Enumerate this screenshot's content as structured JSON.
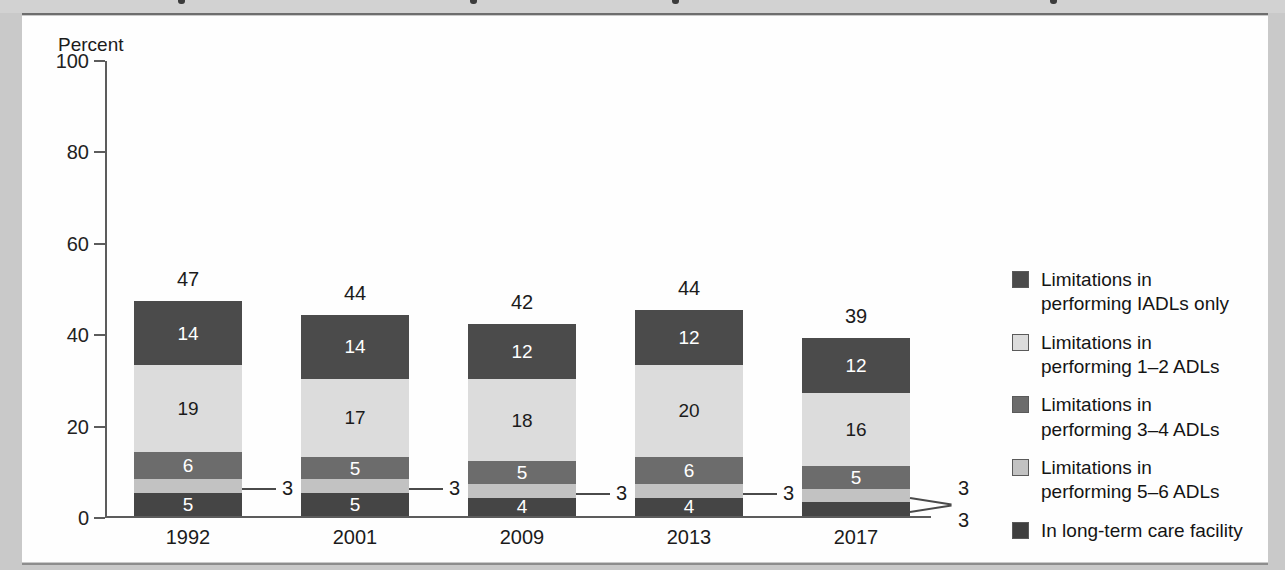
{
  "panel": {
    "axis_title": "Percent"
  },
  "chart_data": {
    "type": "bar",
    "subtype": "stacked-vertical",
    "title": "",
    "xlabel": "",
    "ylabel": "Percent",
    "ylim": [
      0,
      100
    ],
    "yticks": [
      0,
      20,
      40,
      60,
      80,
      100
    ],
    "grid": false,
    "legend_position": "right",
    "categories": [
      "1992",
      "2001",
      "2009",
      "2013",
      "2017"
    ],
    "totals": [
      47,
      44,
      42,
      44,
      39
    ],
    "series": [
      {
        "name": "In long-term care facility",
        "color": "#454545",
        "label_color": "#ffffff",
        "values": [
          5,
          5,
          4,
          4,
          3
        ],
        "labels_outside": [
          false,
          false,
          false,
          false,
          true
        ]
      },
      {
        "name": "Limitations in performing 5–6 ADLs",
        "color": "#c2c2c2",
        "label_color": "#1b1b1b",
        "values": [
          3,
          3,
          3,
          3,
          3
        ],
        "labels_outside": [
          true,
          true,
          true,
          true,
          true
        ]
      },
      {
        "name": "Limitations in performing 3–4 ADLs",
        "color": "#6c6c6c",
        "label_color": "#ffffff",
        "values": [
          6,
          5,
          5,
          6,
          5
        ],
        "labels_outside": [
          false,
          false,
          false,
          false,
          false
        ]
      },
      {
        "name": "Limitations in performing 1–2 ADLs",
        "color": "#dcdcdc",
        "label_color": "#1b1b1b",
        "values": [
          19,
          17,
          18,
          20,
          16
        ],
        "labels_outside": [
          false,
          false,
          false,
          false,
          false
        ]
      },
      {
        "name": "Limitations in performing IADLs only",
        "color": "#4b4b4b",
        "label_color": "#ffffff",
        "values": [
          14,
          14,
          12,
          12,
          12
        ],
        "labels_outside": [
          false,
          false,
          false,
          false,
          false
        ]
      }
    ],
    "callouts": [
      {
        "category": "1992",
        "value": "3"
      },
      {
        "category": "2001",
        "value": "3"
      },
      {
        "category": "2009",
        "value": "3"
      },
      {
        "category": "2013",
        "value": "3"
      },
      {
        "category": "2017",
        "value": "3"
      },
      {
        "category": "2017",
        "value": "3"
      }
    ]
  },
  "legend": {
    "items": [
      {
        "line1": "Limitations in",
        "line2": "performing IADLs only",
        "color": "#4b4b4b"
      },
      {
        "line1": "Limitations in",
        "line2": "performing 1–2 ADLs",
        "color": "#dcdcdc"
      },
      {
        "line1": "Limitations in",
        "line2": "performing 3–4 ADLs",
        "color": "#6c6c6c"
      },
      {
        "line1": "Limitations in",
        "line2": "performing 5–6 ADLs",
        "color": "#c2c2c2"
      },
      {
        "line1": "In long-term care facility",
        "line2": "",
        "color": "#3f3f3f"
      }
    ]
  }
}
